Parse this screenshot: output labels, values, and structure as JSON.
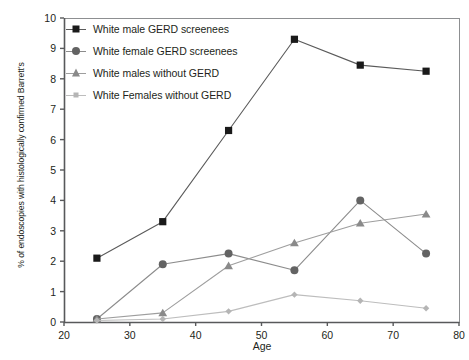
{
  "chart_data": {
    "type": "line",
    "title": "",
    "subtitle": "",
    "xlabel": "Age",
    "ylabel": "% of endoscopies with histologically confirmed Barrett's",
    "xlim": [
      20,
      80
    ],
    "ylim": [
      0,
      10
    ],
    "xticks": [
      20,
      30,
      40,
      50,
      60,
      70,
      80
    ],
    "yticks": [
      0,
      1,
      2,
      3,
      4,
      5,
      6,
      7,
      8,
      9,
      10
    ],
    "grid": false,
    "legend_position": "upper-left-inside",
    "x": [
      25,
      35,
      45,
      55,
      65,
      75
    ],
    "series": [
      {
        "name": "White male GERD screenees",
        "marker": "square",
        "color": "#1a1a1a",
        "line_color": "#5a5a5a",
        "values": [
          2.1,
          3.3,
          6.3,
          9.3,
          8.45,
          8.25
        ]
      },
      {
        "name": "White female GERD screenees",
        "marker": "circle",
        "color": "#636363",
        "line_color": "#8c8c8c",
        "values": [
          0.1,
          1.9,
          2.25,
          1.7,
          4.0,
          2.25
        ]
      },
      {
        "name": "White males without GERD",
        "marker": "triangle",
        "color": "#8a8a8a",
        "line_color": "#9e9e9e",
        "values": [
          0.1,
          0.3,
          1.85,
          2.6,
          3.25,
          3.55
        ]
      },
      {
        "name": "White Females without GERD",
        "marker": "diamond",
        "color": "#b5b5b5",
        "line_color": "#bdbdbd",
        "values": [
          0.05,
          0.1,
          0.35,
          0.9,
          0.7,
          0.45
        ]
      }
    ]
  },
  "axes": {
    "x_tick_labels": [
      "20",
      "30",
      "40",
      "50",
      "60",
      "70",
      "80"
    ],
    "y_tick_labels": [
      "0",
      "1",
      "2",
      "3",
      "4",
      "5",
      "6",
      "7",
      "8",
      "9",
      "10"
    ],
    "x_title": "Age",
    "y_title": "% of endoscopies with histologically confirmed Barrett's"
  },
  "legend": {
    "items": [
      {
        "label": "White male GERD screenees"
      },
      {
        "label": "White female GERD screenees"
      },
      {
        "label": "White males without GERD"
      },
      {
        "label": "White Females without GERD"
      }
    ]
  },
  "colors": {
    "series1": "#1a1a1a",
    "series2": "#636363",
    "series3": "#8a8a8a",
    "series4": "#b5b5b5",
    "axis": "#58595b",
    "text": "#231f20",
    "background": "#ffffff"
  }
}
